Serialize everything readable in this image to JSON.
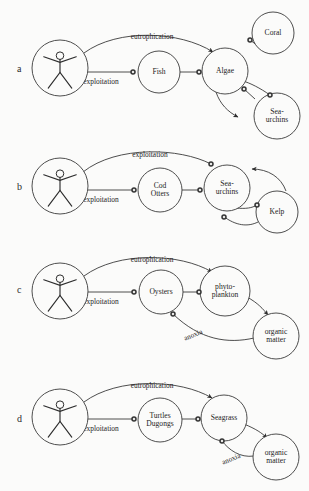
{
  "figure": {
    "background_color": "#fbfbfa",
    "stroke_color": "#3a3a3a",
    "marker_color": "#333333"
  },
  "panels": [
    {
      "letter": "a",
      "letter_x": 17,
      "letter_y": 72,
      "nodes": [
        {
          "id": "human_a",
          "kind": "human",
          "cx": 60,
          "cy": 68,
          "r": 28,
          "lines": []
        },
        {
          "id": "fish",
          "kind": "label",
          "cx": 159,
          "cy": 72,
          "r": 21,
          "lines": [
            "Fish"
          ]
        },
        {
          "id": "algae",
          "kind": "label",
          "cx": 225,
          "cy": 71,
          "r": 23,
          "lines": [
            "Algae"
          ]
        },
        {
          "id": "coral",
          "kind": "label",
          "cx": 273,
          "cy": 33,
          "r": 21,
          "lines": [
            "Coral"
          ]
        },
        {
          "id": "seaurchins_a",
          "kind": "label",
          "cx": 277,
          "cy": 116,
          "r": 23,
          "lines": [
            "Sea-",
            "urchins"
          ]
        }
      ],
      "edges": [
        {
          "id": "a_eutroph",
          "label": "eutrophication",
          "label_x": 152,
          "label_y": 39,
          "path": "M 84 53 C 118 28 180 31 213 52",
          "end": "arrow"
        },
        {
          "id": "a_exploit",
          "label": "exploitation",
          "label_x": 101,
          "label_y": 84,
          "path": "M 88 72 L 133 72",
          "end": "dot"
        },
        {
          "id": "a_fish_algae",
          "label": "",
          "label_x": 0,
          "label_y": 0,
          "path": "M 180 72 L 199 72",
          "end": "dot"
        },
        {
          "id": "a_algae_coral",
          "label": "",
          "label_x": 0,
          "label_y": 0,
          "path": "M 262 49 L 250 40",
          "end": "dot"
        },
        {
          "id": "a_algae_urchin",
          "label": "",
          "label_x": 0,
          "label_y": 0,
          "path": "M 216 92 C 220 104 228 112 238 117",
          "end": "arrow"
        },
        {
          "id": "a_urchin_algae1",
          "label": "",
          "label_x": 0,
          "label_y": 0,
          "path": "M 255 99 L 244 89",
          "end": "dot"
        },
        {
          "id": "a_urchin_algae2",
          "label": "",
          "label_x": 0,
          "label_y": 0,
          "path": "M 270 95 C 260 88 250 83 243 81",
          "end": "dot"
        }
      ],
      "markers": [
        {
          "x": 133,
          "y": 72
        },
        {
          "x": 199,
          "y": 72
        },
        {
          "x": 250,
          "y": 40
        },
        {
          "x": 244,
          "y": 89
        },
        {
          "x": 270,
          "y": 95
        }
      ]
    },
    {
      "letter": "b",
      "letter_x": 17,
      "letter_y": 190,
      "nodes": [
        {
          "id": "human_b",
          "kind": "human",
          "cx": 60,
          "cy": 186,
          "r": 28,
          "lines": []
        },
        {
          "id": "cod_otters",
          "kind": "label",
          "cx": 160,
          "cy": 190,
          "r": 22,
          "lines": [
            "Cod",
            "Otters"
          ]
        },
        {
          "id": "seaurchins_b",
          "kind": "label",
          "cx": 227,
          "cy": 188,
          "r": 23,
          "lines": [
            "Sea-",
            "urchins"
          ]
        },
        {
          "id": "kelp",
          "kind": "label",
          "cx": 277,
          "cy": 212,
          "r": 21,
          "lines": [
            "Kelp"
          ]
        }
      ],
      "edges": [
        {
          "id": "b_eutroph",
          "label": "exploitation",
          "label_x": 150,
          "label_y": 157,
          "path": "M 83 172 C 117 145 180 148 211 164",
          "end": "dot"
        },
        {
          "id": "b_exploit",
          "label": "exploitation",
          "label_x": 101,
          "label_y": 202,
          "path": "M 88 190 L 134 190",
          "end": "dot"
        },
        {
          "id": "b_cod_urchin",
          "label": "",
          "label_x": 0,
          "label_y": 0,
          "path": "M 182 190 L 200 190",
          "end": "dot"
        },
        {
          "id": "b_kelp_urchin",
          "label": "",
          "label_x": 0,
          "label_y": 0,
          "path": "M 286 191 C 281 177 268 169 252 169",
          "end": "arrow"
        },
        {
          "id": "b_urchin_kelp1",
          "label": "",
          "label_x": 0,
          "label_y": 0,
          "path": "M 236 208 C 246 209 252 208 257 205",
          "end": "dot"
        },
        {
          "id": "b_urchin_kelp2",
          "label": "",
          "label_x": 0,
          "label_y": 0,
          "path": "M 223 216 C 236 226 248 227 258 222",
          "end": "dot"
        }
      ],
      "markers": [
        {
          "x": 211,
          "y": 164
        },
        {
          "x": 134,
          "y": 190
        },
        {
          "x": 200,
          "y": 190
        },
        {
          "x": 257,
          "y": 205
        },
        {
          "x": 224,
          "y": 217
        }
      ]
    },
    {
      "letter": "c",
      "letter_x": 17,
      "letter_y": 293,
      "nodes": [
        {
          "id": "human_c",
          "kind": "human",
          "cx": 60,
          "cy": 291,
          "r": 28,
          "lines": []
        },
        {
          "id": "oysters",
          "kind": "label",
          "cx": 161,
          "cy": 292,
          "r": 22,
          "lines": [
            "Oysters"
          ]
        },
        {
          "id": "phytoplankton",
          "kind": "label",
          "cx": 225,
          "cy": 291,
          "r": 25,
          "lines": [
            "phyto-",
            "plankton"
          ]
        },
        {
          "id": "organic_c",
          "kind": "label",
          "cx": 276,
          "cy": 336,
          "r": 23,
          "lines": [
            "organic",
            "matter"
          ]
        }
      ],
      "edges": [
        {
          "id": "c_eutroph",
          "label": "eutrophication",
          "label_x": 152,
          "label_y": 262,
          "path": "M 84 276 C 118 251 180 253 212 272",
          "end": "arrow"
        },
        {
          "id": "c_exploit",
          "label": "exploitation",
          "label_x": 101,
          "label_y": 304,
          "path": "M 88 292 L 134 292",
          "end": "dot"
        },
        {
          "id": "c_oyster_phyto",
          "label": "",
          "label_x": 0,
          "label_y": 0,
          "path": "M 183 292 L 199 292",
          "end": "dot"
        },
        {
          "id": "c_phyto_organic",
          "label": "",
          "label_x": 0,
          "label_y": 0,
          "path": "M 247 297 C 258 303 263 309 268 315",
          "end": "arrow"
        },
        {
          "id": "c_anoxia",
          "label": "anoxia",
          "label_x": 194,
          "label_y": 337,
          "path": "M 254 338 C 228 344 200 340 173 314",
          "end": "dot"
        }
      ],
      "markers": [
        {
          "x": 134,
          "y": 292
        },
        {
          "x": 199,
          "y": 292
        },
        {
          "x": 173,
          "y": 314
        }
      ]
    },
    {
      "letter": "d",
      "letter_x": 17,
      "letter_y": 422,
      "nodes": [
        {
          "id": "human_d",
          "kind": "human",
          "cx": 60,
          "cy": 417,
          "r": 28,
          "lines": []
        },
        {
          "id": "turtles_dugongs",
          "kind": "label",
          "cx": 160,
          "cy": 420,
          "r": 22,
          "lines": [
            "Turtles",
            "Dugongs"
          ]
        },
        {
          "id": "seagrass",
          "kind": "label",
          "cx": 224,
          "cy": 418,
          "r": 23,
          "lines": [
            "Seagrass"
          ]
        },
        {
          "id": "organic_d",
          "kind": "label",
          "cx": 276,
          "cy": 457,
          "r": 23,
          "lines": [
            "organic",
            "matter"
          ]
        }
      ],
      "edges": [
        {
          "id": "d_eutroph",
          "label": "eutrophication",
          "label_x": 152,
          "label_y": 388,
          "path": "M 84 402 C 118 377 180 379 212 398",
          "end": "arrow"
        },
        {
          "id": "d_exploit",
          "label": "exploitation",
          "label_x": 101,
          "label_y": 431,
          "path": "M 88 419 L 134 419",
          "end": "dot"
        },
        {
          "id": "d_turtle_seagrass",
          "label": "",
          "label_x": 0,
          "label_y": 0,
          "path": "M 182 419 L 198 419",
          "end": "dot"
        },
        {
          "id": "d_seagrass_organic",
          "label": "",
          "label_x": 0,
          "label_y": 0,
          "path": "M 244 424 C 256 429 262 433 267 438",
          "end": "arrow"
        },
        {
          "id": "d_anoxia",
          "label": "anoxia",
          "label_x": 232,
          "label_y": 461,
          "path": "M 254 456 C 240 458 229 450 222 441",
          "end": "dot"
        }
      ],
      "markers": [
        {
          "x": 134,
          "y": 419
        },
        {
          "x": 198,
          "y": 419
        },
        {
          "x": 222,
          "y": 441
        }
      ]
    }
  ]
}
